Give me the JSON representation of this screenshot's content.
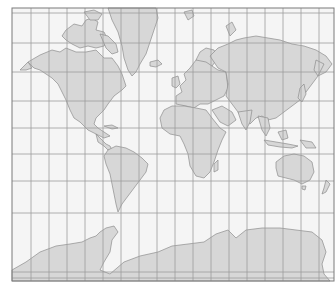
{
  "map": {
    "type": "world map",
    "projection": "Mercator",
    "colors": {
      "ocean": "#f5f5f5",
      "land": "#d7d7d7",
      "coastline": "#8c8c8c",
      "grid": "#9c9c9c",
      "frame": "#7a7a7a"
    },
    "frame": {
      "x": 12,
      "y": 8,
      "width": 322,
      "height": 273
    },
    "grid": {
      "meridians_x": [
        31,
        49,
        67,
        85,
        103,
        121,
        139,
        157,
        175,
        193,
        211,
        229,
        247,
        265,
        283,
        301,
        319
      ],
      "parallels_y": [
        13,
        43,
        72,
        101,
        128,
        154,
        181,
        213,
        272,
        278
      ]
    },
    "regions": [
      "north-america",
      "greenland",
      "canadian-arctic-archipelago",
      "central-america",
      "south-america",
      "europe",
      "africa",
      "madagascar",
      "asia",
      "arabian-peninsula",
      "indian-subcontinent",
      "southeast-asia",
      "japan",
      "australia",
      "new-zealand",
      "antarctica",
      "svalbard",
      "novaya-zemlya",
      "iceland",
      "british-isles"
    ]
  }
}
